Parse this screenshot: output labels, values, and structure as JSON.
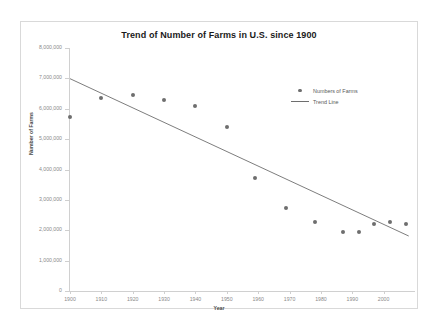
{
  "chart_data": {
    "type": "scatter",
    "title": "Trend of Number of Farms in U.S. since 1900",
    "xlabel": "Year",
    "ylabel": "Number of Farms",
    "xlim": [
      1900,
      2010
    ],
    "ylim": [
      0,
      8000000
    ],
    "grid": false,
    "legend_position": "upper-right",
    "x_ticks": [
      "1900",
      "1910",
      "1920",
      "1930",
      "1940",
      "1950",
      "1960",
      "1970",
      "1980",
      "1990",
      "2000"
    ],
    "x_tick_values": [
      1900,
      1910,
      1920,
      1930,
      1940,
      1950,
      1960,
      1970,
      1980,
      1990,
      2000
    ],
    "y_ticks": [
      "0",
      "1,000,000",
      "2,000,000",
      "3,000,000",
      "4,000,000",
      "5,000,000",
      "6,000,000",
      "7,000,000",
      "8,000,000"
    ],
    "y_tick_values": [
      0,
      1000000,
      2000000,
      3000000,
      4000000,
      5000000,
      6000000,
      7000000,
      8000000
    ],
    "series": [
      {
        "name": "Numbers of Farms",
        "type": "scatter",
        "marker_color": "#6e6e6e",
        "x": [
          1900,
          1910,
          1920,
          1930,
          1940,
          1950,
          1959,
          1969,
          1978,
          1987,
          1992,
          1997,
          2002,
          2007
        ],
        "y": [
          5740000,
          6360000,
          6450000,
          6290000,
          6100000,
          5390000,
          3710000,
          2730000,
          2260000,
          1930000,
          1930000,
          2210000,
          2260000,
          2200000
        ]
      },
      {
        "name": "Trend Line",
        "type": "line",
        "line_color": "#6e6e6e",
        "x": [
          1900,
          2008
        ],
        "y": [
          6990000,
          1810000
        ]
      }
    ],
    "legend": [
      {
        "label": "Numbers of Farms",
        "key": "marker"
      },
      {
        "label": "Trend Line",
        "key": "line"
      }
    ]
  }
}
